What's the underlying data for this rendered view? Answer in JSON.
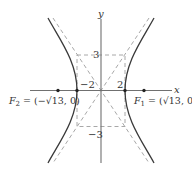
{
  "diagram": {
    "type": "hyperbola",
    "equation_implied": "x^2/4 - y^2/9 = 1",
    "axes": {
      "x_label": "x",
      "y_label": "y"
    },
    "tick_labels": {
      "x_pos": "2",
      "x_neg": "−2",
      "y_pos": "3",
      "y_neg": "−3"
    },
    "foci": [
      {
        "name": "F1",
        "label_main": "F",
        "label_sub": "1",
        "label_rest": " = (√13, 0)"
      },
      {
        "name": "F2",
        "label_main": "F",
        "label_sub": "2",
        "label_rest": " = (−√13, 0)"
      }
    ],
    "colors": {
      "curve": "#3a3a3a",
      "axes": "#707070",
      "dashed": "#a8a8a8"
    }
  }
}
